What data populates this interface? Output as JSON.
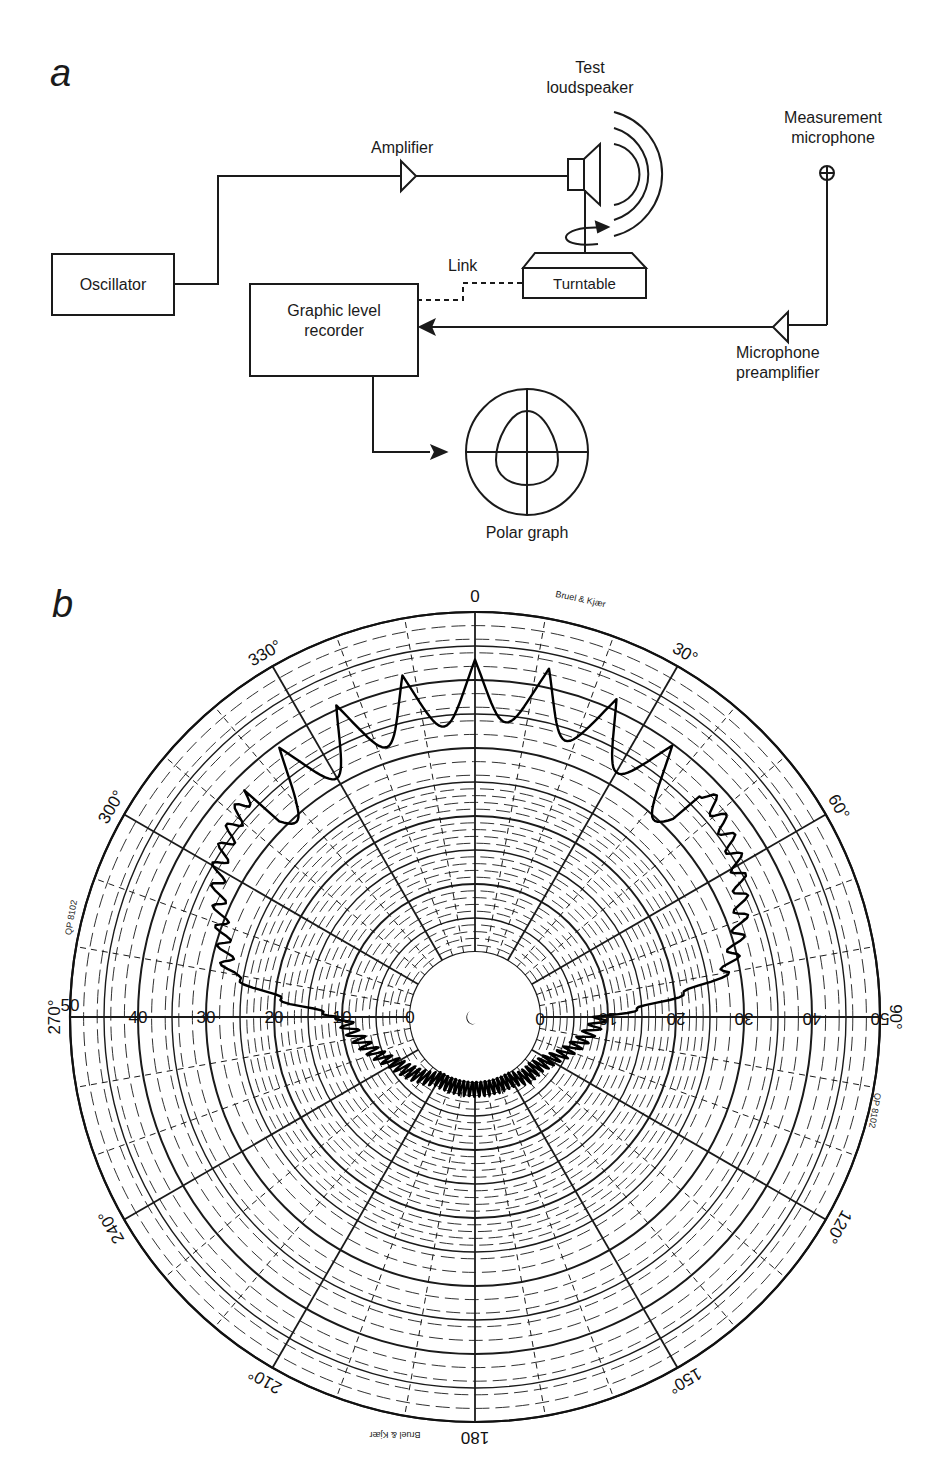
{
  "panels": {
    "a": {
      "letter": "a"
    },
    "b": {
      "letter": "b"
    }
  },
  "diagram": {
    "nodes": {
      "oscillator": "Oscillator",
      "amplifier": "Amplifier",
      "test_loudspeaker_line1": "Test",
      "test_loudspeaker_line2": "loudspeaker",
      "measurement_mic_line1": "Measurement",
      "measurement_mic_line2": "microphone",
      "turntable": "Turntable",
      "link": "Link",
      "recorder_line1": "Graphic level",
      "recorder_line2": "recorder",
      "preamp_line1": "Microphone",
      "preamp_line2": "preamplifier",
      "polar_graph": "Polar graph"
    },
    "edges": [
      {
        "from": "Oscillator",
        "to": "Amplifier",
        "style": "solid"
      },
      {
        "from": "Amplifier",
        "to": "Test loudspeaker",
        "style": "solid"
      },
      {
        "from": "Turntable",
        "to": "Graphic level recorder",
        "style": "dashed",
        "label": "Link"
      },
      {
        "from": "Measurement microphone",
        "to": "Microphone preamplifier",
        "style": "solid"
      },
      {
        "from": "Microphone preamplifier",
        "to": "Graphic level recorder",
        "style": "arrow"
      },
      {
        "from": "Graphic level recorder",
        "to": "Polar graph",
        "style": "arrow"
      }
    ]
  },
  "chart_data": {
    "type": "polar",
    "title": "",
    "paper_marks": {
      "brand_top": "Bruel & Kjær",
      "brand_bottom": "Bruel & Kjær",
      "form_left": "QP 8102",
      "form_right": "QP 8102"
    },
    "angle_labels": [
      "0",
      "30°",
      "60°",
      "90°",
      "120°",
      "150°",
      "180",
      "210°",
      "240°",
      "270°",
      "300°",
      "330°"
    ],
    "radial_labels_left": [
      "50",
      "40",
      "30",
      "20",
      "10",
      "0"
    ],
    "radial_labels_right": [
      "0",
      "10",
      "20",
      "30",
      "40",
      "50"
    ],
    "radial_range": [
      0,
      50
    ],
    "radial_unit": "dB",
    "grid": true,
    "series": [
      {
        "name": "Polar response",
        "angles_deg": [
          270,
          280,
          290,
          300,
          310,
          320,
          330,
          340,
          350,
          0,
          10,
          20,
          30,
          40,
          50,
          60,
          70,
          80,
          90,
          100,
          110,
          120,
          130,
          140,
          150,
          160,
          170,
          180,
          190,
          200,
          210,
          220,
          230,
          240,
          250,
          260
        ],
        "values": [
          10,
          27,
          30,
          34,
          36,
          39,
          40,
          41,
          42,
          43,
          43,
          42,
          41,
          39,
          37,
          35,
          32,
          28,
          9,
          7,
          5,
          3,
          2,
          2,
          1,
          1,
          1,
          1,
          1,
          1,
          1,
          2,
          3,
          4,
          6,
          8
        ]
      }
    ]
  }
}
